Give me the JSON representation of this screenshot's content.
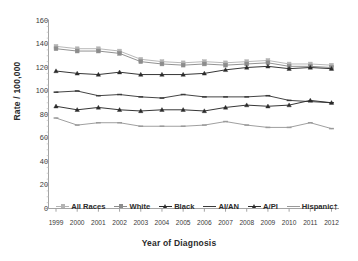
{
  "chart_data": {
    "type": "line",
    "title": "",
    "xlabel": "Year of Diagnosis",
    "ylabel": "Rate / 100,000",
    "x": [
      1999,
      2000,
      2001,
      2002,
      2003,
      2004,
      2005,
      2006,
      2007,
      2008,
      2009,
      2010,
      2011,
      2012
    ],
    "xlim": [
      1999,
      2012
    ],
    "ylim": [
      0,
      160
    ],
    "yticks": [
      0,
      20,
      40,
      60,
      80,
      100,
      120,
      140,
      160
    ],
    "xticks": [
      "1999",
      "2000",
      "2001",
      "2002",
      "2003",
      "2004",
      "2005",
      "2006",
      "2007",
      "2008",
      "2009",
      "2010",
      "2011",
      "2012"
    ],
    "grid": false,
    "legend_position": "inside-bottom-center",
    "series": [
      {
        "name": "All Races",
        "color": "#b4b4b4",
        "marker": "square",
        "values": [
          138,
          136,
          136,
          134,
          127,
          125,
          124,
          125,
          124,
          125,
          126,
          123,
          123,
          122
        ]
      },
      {
        "name": "White",
        "color": "#8c8c8c",
        "marker": "square",
        "values": [
          136,
          134,
          134,
          132,
          125,
          123,
          122,
          123,
          122,
          123,
          124,
          121,
          121,
          120
        ]
      },
      {
        "name": "Black",
        "color": "#2b2b2b",
        "marker": "triangle",
        "values": [
          117,
          115,
          114,
          116,
          114,
          114,
          114,
          115,
          118,
          120,
          121,
          119,
          120,
          119
        ]
      },
      {
        "name": "AI/AN",
        "color": "#3a3a3a",
        "marker": "dash",
        "values": [
          99,
          100,
          96,
          97,
          95,
          94,
          97,
          95,
          95,
          95,
          96,
          92,
          91,
          90
        ]
      },
      {
        "name": "A/PI",
        "color": "#2b2b2b",
        "marker": "triangle",
        "values": [
          87,
          84,
          86,
          84,
          83,
          84,
          84,
          83,
          86,
          88,
          87,
          88,
          92,
          90
        ]
      },
      {
        "name": "Hispanic†",
        "color": "#9a9a9a",
        "marker": "dash",
        "values": [
          77,
          71,
          73,
          73,
          70,
          70,
          70,
          71,
          74,
          71,
          69,
          69,
          73,
          68
        ]
      }
    ]
  },
  "axes": {
    "x_axis_title": "Year of Diagnosis",
    "y_axis_title": "Rate / 100,000"
  }
}
